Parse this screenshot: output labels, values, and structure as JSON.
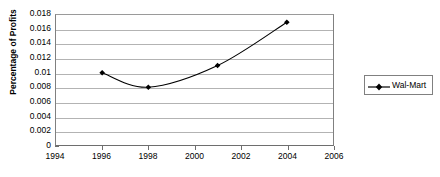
{
  "chart_data": {
    "type": "line",
    "title": "",
    "subtitle": "",
    "xlabel": "",
    "ylabel": "Percentage of Profits",
    "xlim": [
      1994,
      2006
    ],
    "ylim": [
      0,
      0.018
    ],
    "grid": "horizontal",
    "legend_position": "right",
    "x_ticks": [
      "1994",
      "1996",
      "1998",
      "2000",
      "2002",
      "2004",
      "2006"
    ],
    "x_tick_values": [
      1994,
      1996,
      1998,
      2000,
      2002,
      2004,
      2006
    ],
    "y_ticks": [
      "0",
      "0.002",
      "0.004",
      "0.006",
      "0.008",
      "0.01",
      "0.012",
      "0.014",
      "0.016",
      "0.018"
    ],
    "y_tick_values": [
      0,
      0.002,
      0.004,
      0.006,
      0.008,
      0.01,
      0.012,
      0.014,
      0.016,
      0.018
    ],
    "series": [
      {
        "name": "Wal-Mart",
        "color": "#000000",
        "marker": "diamond",
        "smoothed": true,
        "x": [
          1996,
          1998,
          2001,
          2004
        ],
        "values": [
          0.01,
          0.008,
          0.011,
          0.017
        ],
        "points": [
          {
            "x": 1996,
            "y": 0.01
          },
          {
            "x": 1998,
            "y": 0.008
          },
          {
            "x": 2001,
            "y": 0.011
          },
          {
            "x": 2004,
            "y": 0.017
          }
        ]
      }
    ]
  },
  "legend": {
    "entries": [
      {
        "label": "Wal-Mart"
      }
    ]
  },
  "colors": {
    "series_line": "#000000",
    "gridline": "#b3b3b3",
    "axis": "#6e6e6e",
    "plot_background": "#ffffff",
    "page_background": "#ffffff"
  }
}
